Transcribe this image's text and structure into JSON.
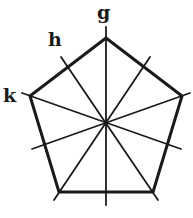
{
  "diagram": {
    "type": "regular pentagon with lines of symmetry",
    "stroke_color": "#1a1a1a",
    "labels": [
      {
        "id": "g",
        "text": "g",
        "x": 97,
        "y": 3
      },
      {
        "id": "h",
        "text": "h",
        "x": 48,
        "y": 30
      },
      {
        "id": "k",
        "text": "k",
        "x": 3,
        "y": 86
      }
    ],
    "center": [
      106,
      123
    ],
    "vertices": [
      [
        106,
        38
      ],
      [
        182,
        96
      ],
      [
        153,
        192
      ],
      [
        59,
        192
      ],
      [
        30,
        96
      ]
    ],
    "symmetry_axes": [
      {
        "name": "g",
        "from": [
          106,
          27
        ],
        "to": [
          106,
          205
        ]
      },
      {
        "name": "h",
        "from": [
          61,
          57
        ],
        "to": [
          158,
          200
        ]
      },
      {
        "name": "k",
        "from": [
          22,
          93
        ],
        "to": [
          181,
          149
        ]
      },
      {
        "name": "axis-4",
        "from": [
          190,
          93
        ],
        "to": [
          32,
          149
        ]
      },
      {
        "name": "axis-5",
        "from": [
          150,
          57
        ],
        "to": [
          54,
          200
        ]
      }
    ]
  }
}
